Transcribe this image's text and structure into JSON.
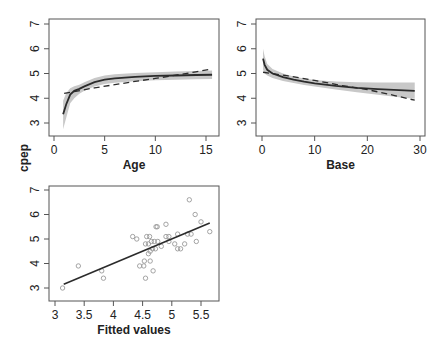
{
  "figure": {
    "shared_ylabel": "cpep"
  },
  "chart_data": [
    {
      "id": "age",
      "type": "line",
      "title": "",
      "xlabel": "Age",
      "ylabel": "cpep",
      "xlim": [
        0,
        16
      ],
      "ylim": [
        2.5,
        7.3
      ],
      "xticks": [
        0,
        5,
        10,
        15
      ],
      "yticks": [
        3,
        4,
        5,
        6,
        7
      ],
      "grid": false,
      "series": [
        {
          "name": "smooth fit",
          "style": "solid",
          "x": [
            0.9,
            1.2,
            1.6,
            2,
            2.5,
            3,
            4,
            5,
            6,
            8,
            10,
            12,
            14,
            15.6
          ],
          "values": [
            3.35,
            3.75,
            4.15,
            4.3,
            4.38,
            4.48,
            4.65,
            4.75,
            4.8,
            4.86,
            4.9,
            4.92,
            4.94,
            4.95
          ]
        },
        {
          "name": "ci upper",
          "style": "band",
          "x": [
            0.9,
            1.2,
            1.6,
            2,
            2.5,
            3,
            4,
            5,
            6,
            8,
            10,
            12,
            14,
            15.6
          ],
          "values": [
            3.9,
            4.2,
            4.4,
            4.48,
            4.55,
            4.65,
            4.82,
            4.92,
            4.97,
            5.02,
            5.05,
            5.08,
            5.1,
            5.12
          ]
        },
        {
          "name": "ci lower",
          "style": "band",
          "x": [
            0.9,
            1.2,
            1.6,
            2,
            2.5,
            3,
            4,
            5,
            6,
            8,
            10,
            12,
            14,
            15.6
          ],
          "values": [
            2.75,
            3.2,
            3.8,
            4.0,
            4.18,
            4.3,
            4.47,
            4.58,
            4.63,
            4.69,
            4.73,
            4.75,
            4.77,
            4.78
          ]
        },
        {
          "name": "parametric fit",
          "style": "dashed",
          "x": [
            1,
            2,
            4,
            6,
            8,
            10,
            12,
            14,
            15.6
          ],
          "values": [
            4.2,
            4.27,
            4.42,
            4.55,
            4.68,
            4.8,
            4.93,
            5.07,
            5.18
          ]
        }
      ]
    },
    {
      "id": "base",
      "type": "line",
      "title": "",
      "xlabel": "Base",
      "ylabel": "",
      "xlim": [
        -1,
        31
      ],
      "ylim": [
        2.5,
        7.3
      ],
      "xticks": [
        0,
        10,
        20,
        30
      ],
      "yticks": [
        3,
        4,
        5,
        6,
        7
      ],
      "grid": false,
      "series": [
        {
          "name": "smooth fit",
          "style": "solid",
          "x": [
            0.2,
            0.5,
            1,
            2,
            4,
            6,
            8,
            10,
            14,
            18,
            22,
            26,
            29
          ],
          "values": [
            5.6,
            5.35,
            5.15,
            5.0,
            4.85,
            4.75,
            4.67,
            4.6,
            4.5,
            4.42,
            4.37,
            4.33,
            4.3
          ]
        },
        {
          "name": "ci upper",
          "style": "band",
          "x": [
            0.2,
            0.5,
            1,
            2,
            4,
            6,
            8,
            10,
            14,
            18,
            22,
            26,
            29
          ],
          "values": [
            6.0,
            5.7,
            5.38,
            5.18,
            5.0,
            4.88,
            4.8,
            4.74,
            4.68,
            4.65,
            4.64,
            4.64,
            4.64
          ]
        },
        {
          "name": "ci lower",
          "style": "band",
          "x": [
            0.2,
            0.5,
            1,
            2,
            4,
            6,
            8,
            10,
            14,
            18,
            22,
            26,
            29
          ],
          "values": [
            5.15,
            5.0,
            4.92,
            4.82,
            4.7,
            4.62,
            4.54,
            4.47,
            4.35,
            4.24,
            4.14,
            4.04,
            3.98
          ]
        },
        {
          "name": "parametric fit",
          "style": "dashed",
          "x": [
            0.2,
            5,
            10,
            15,
            20,
            25,
            29
          ],
          "values": [
            5.05,
            4.9,
            4.72,
            4.52,
            4.35,
            4.12,
            3.92
          ]
        }
      ]
    },
    {
      "id": "fitted",
      "type": "scatter",
      "title": "",
      "xlabel": "Fitted values",
      "ylabel": "",
      "xlim": [
        3.0,
        5.7
      ],
      "ylim": [
        2.5,
        7.3
      ],
      "xticks": [
        3,
        3.5,
        4,
        4.5,
        5,
        5.5
      ],
      "yticks": [
        3,
        4,
        5,
        6,
        7
      ],
      "grid": false,
      "points": [
        [
          3.13,
          3.0
        ],
        [
          3.4,
          3.9
        ],
        [
          3.8,
          3.7
        ],
        [
          3.83,
          3.4
        ],
        [
          4.33,
          5.1
        ],
        [
          4.4,
          5.0
        ],
        [
          4.45,
          3.9
        ],
        [
          4.52,
          3.9
        ],
        [
          4.53,
          4.1
        ],
        [
          4.55,
          3.4
        ],
        [
          4.55,
          4.8
        ],
        [
          4.57,
          5.1
        ],
        [
          4.6,
          4.8
        ],
        [
          4.6,
          4.4
        ],
        [
          4.62,
          5.1
        ],
        [
          4.63,
          4.5
        ],
        [
          4.63,
          4.1
        ],
        [
          4.65,
          4.9
        ],
        [
          4.67,
          4.6
        ],
        [
          4.68,
          3.7
        ],
        [
          4.7,
          4.9
        ],
        [
          4.72,
          4.6
        ],
        [
          4.73,
          5.5
        ],
        [
          4.75,
          5.5
        ],
        [
          4.76,
          4.9
        ],
        [
          4.82,
          4.7
        ],
        [
          4.9,
          5.1
        ],
        [
          4.9,
          5.6
        ],
        [
          4.95,
          5.1
        ],
        [
          4.95,
          4.9
        ],
        [
          5.05,
          4.8
        ],
        [
          5.1,
          5.2
        ],
        [
          5.1,
          4.6
        ],
        [
          5.15,
          4.6
        ],
        [
          5.22,
          4.8
        ],
        [
          5.27,
          5.2
        ],
        [
          5.3,
          6.6
        ],
        [
          5.33,
          5.2
        ],
        [
          5.4,
          6.0
        ],
        [
          5.42,
          4.9
        ],
        [
          5.5,
          5.7
        ],
        [
          5.65,
          5.3
        ]
      ],
      "line": {
        "name": "identity / fitted line",
        "x": [
          3.15,
          5.65
        ],
        "values": [
          3.15,
          5.65
        ]
      }
    }
  ],
  "colors": {
    "line": "#2b2b2b",
    "band": "#c8c8c8",
    "points": "#9a9a9a",
    "axis": "#555555"
  }
}
